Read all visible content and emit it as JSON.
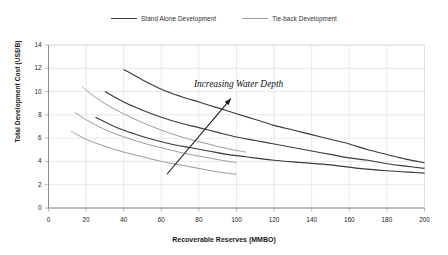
{
  "chart_data": {
    "type": "line",
    "title": "",
    "xlabel": "Recoverable Reserves (MMBO)",
    "ylabel": "Total Development Cost (US$/B)",
    "xlim": [
      0,
      200
    ],
    "ylim": [
      0,
      14
    ],
    "xticks": [
      0,
      20,
      40,
      60,
      80,
      100,
      120,
      140,
      160,
      180,
      200
    ],
    "yticks": [
      0,
      2,
      4,
      6,
      8,
      10,
      12,
      14
    ],
    "grid": true,
    "legend_position": "top-center",
    "annotations": [
      {
        "text": "Increasing Water Depth",
        "x": 105,
        "y": 10.6,
        "arrow_from": [
          63,
          2.9
        ],
        "arrow_to": [
          97,
          9.4
        ]
      }
    ],
    "legend": [
      {
        "name": "Stand Alone Development",
        "color": "#3b3b3b"
      },
      {
        "name": "Tie-back Development",
        "color": "#9b9b9b"
      }
    ],
    "series": [
      {
        "name": "Stand Alone Development - deep",
        "group": "Stand Alone Development",
        "color": "#3b3b3b",
        "x": [
          40,
          50,
          60,
          70,
          80,
          90,
          100,
          110,
          120,
          130,
          140,
          150,
          160,
          170,
          180,
          190,
          200
        ],
        "y": [
          11.9,
          11.0,
          10.2,
          9.6,
          9.1,
          8.6,
          8.1,
          7.6,
          7.1,
          6.7,
          6.3,
          5.9,
          5.5,
          5.0,
          4.6,
          4.2,
          3.9
        ]
      },
      {
        "name": "Stand Alone Development - mid",
        "group": "Stand Alone Development",
        "color": "#3b3b3b",
        "x": [
          30,
          40,
          50,
          60,
          70,
          80,
          90,
          100,
          110,
          120,
          130,
          140,
          150,
          160,
          170,
          180,
          190,
          200
        ],
        "y": [
          10.0,
          9.1,
          8.4,
          7.8,
          7.3,
          6.9,
          6.5,
          6.1,
          5.8,
          5.5,
          5.2,
          4.9,
          4.6,
          4.3,
          4.1,
          3.8,
          3.6,
          3.4
        ]
      },
      {
        "name": "Stand Alone Development - shallow",
        "group": "Stand Alone Development",
        "color": "#3b3b3b",
        "x": [
          25,
          35,
          45,
          55,
          65,
          75,
          85,
          95,
          105,
          120,
          135,
          150,
          165,
          180,
          195,
          200
        ],
        "y": [
          7.8,
          7.0,
          6.4,
          5.9,
          5.5,
          5.2,
          4.9,
          4.6,
          4.4,
          4.1,
          3.9,
          3.7,
          3.4,
          3.2,
          3.05,
          3.0
        ]
      },
      {
        "name": "Tie-back Development - deep",
        "group": "Tie-back Development",
        "color": "#9b9b9b",
        "x": [
          18,
          25,
          35,
          45,
          55,
          65,
          75,
          85,
          95,
          105
        ],
        "y": [
          10.4,
          9.5,
          8.5,
          7.7,
          7.0,
          6.4,
          5.9,
          5.5,
          5.1,
          4.8
        ]
      },
      {
        "name": "Tie-back Development - mid",
        "group": "Tie-back Development",
        "color": "#9b9b9b",
        "x": [
          14,
          22,
          32,
          42,
          52,
          62,
          72,
          82,
          92,
          100
        ],
        "y": [
          8.2,
          7.4,
          6.6,
          6.0,
          5.5,
          5.1,
          4.7,
          4.4,
          4.1,
          3.9
        ]
      },
      {
        "name": "Tie-back Development - shallow",
        "group": "Tie-back Development",
        "color": "#9b9b9b",
        "x": [
          12,
          20,
          30,
          40,
          50,
          60,
          70,
          80,
          90,
          100
        ],
        "y": [
          6.6,
          5.9,
          5.3,
          4.8,
          4.4,
          4.0,
          3.7,
          3.4,
          3.1,
          2.9
        ]
      }
    ]
  },
  "legend": {
    "stand_alone": "Stand Alone Development",
    "tie_back": "Tie-back Development"
  },
  "axes": {
    "y_title": "Total Development Cost (US$/B)",
    "x_title": "Recoverable Reserves (MMBO)",
    "y_ticks": [
      "0",
      "2",
      "4",
      "6",
      "8",
      "10",
      "12",
      "14"
    ],
    "x_ticks": [
      "0",
      "20",
      "40",
      "60",
      "80",
      "100",
      "120",
      "140",
      "160",
      "180",
      "200"
    ]
  },
  "annotation": {
    "text": "Increasing Water Depth"
  },
  "colors": {
    "stand_alone": "#3b3b3b",
    "tie_back": "#9b9b9b",
    "grid": "#d7d7d7",
    "axis": "#6f6f6f"
  }
}
